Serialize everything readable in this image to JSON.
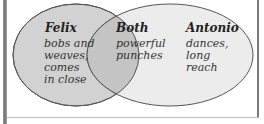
{
  "diagram": {
    "type": "venn",
    "sets": [
      {
        "title": "Felix",
        "lines": [
          "bobs and",
          "weaves,",
          "comes",
          "in close"
        ],
        "fill": "#d2d2d2"
      },
      {
        "title": "Antonio",
        "lines": [
          "dances,",
          "long",
          "reach"
        ],
        "fill": "#ececec"
      }
    ],
    "intersection": {
      "title": "Both",
      "lines": [
        "powerful",
        "punches"
      ],
      "fill": "#c4c4c4"
    }
  }
}
